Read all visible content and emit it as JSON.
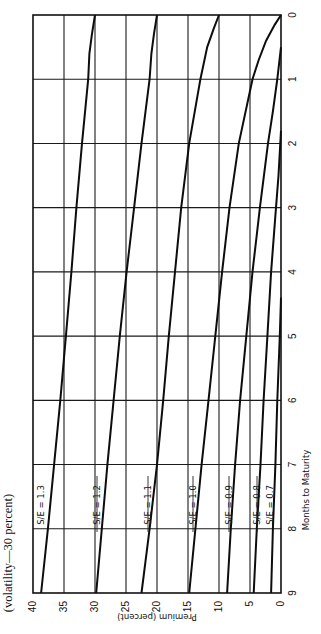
{
  "chart_data": {
    "type": "line",
    "title": "(volatility—30 percent)",
    "xlabel": "Months to Maturity",
    "ylabel": "Premium (percent)",
    "orientation": "rotated 90 degrees clockwise on page",
    "xlim": [
      9,
      0
    ],
    "ylim": [
      0,
      40
    ],
    "grid": true,
    "x_ticks": [
      "9",
      "8",
      "7",
      "6",
      "5",
      "4",
      "3",
      "2",
      "1",
      "0"
    ],
    "y_ticks": [
      "40",
      "35",
      "30",
      "25",
      "20",
      "15",
      "10",
      "5",
      "0"
    ],
    "x": [
      0,
      1,
      2,
      4,
      6,
      9
    ],
    "series": [
      {
        "name": "S/E = 1.3",
        "values": [
          30.0,
          31.0,
          31.9,
          33.7,
          35.6,
          38.7
        ]
      },
      {
        "name": "S/E = 1.2",
        "values": [
          20.0,
          21.0,
          22.3,
          25.0,
          27.0,
          29.8
        ]
      },
      {
        "name": "S/E = 1.1",
        "values": [
          10.0,
          14.0,
          13.3,
          16.3,
          18.7,
          22.5
        ]
      },
      {
        "name": "S/E = 1.0",
        "values": [
          0.0,
          4.7,
          6.7,
          9.5,
          11.5,
          14.8
        ]
      },
      {
        "name": "S/E = 0.9",
        "values": [
          0.0,
          0.5,
          2.1,
          4.7,
          5.8,
          8.7
        ]
      },
      {
        "name": "S/E = 0.8",
        "values": [
          0.0,
          0.0,
          0.2,
          1.6,
          2.7,
          4.4
        ]
      },
      {
        "name": "S/E = 0.7",
        "values": [
          0.0,
          0.0,
          0.0,
          0.0,
          0.6,
          1.6
        ]
      }
    ],
    "legend_position": "inline labels near month 7.5"
  },
  "labels": {
    "title": "(volatility—30 percent)",
    "xlabel": "Months to Maturity",
    "ylabel": "Premium (percent)"
  }
}
